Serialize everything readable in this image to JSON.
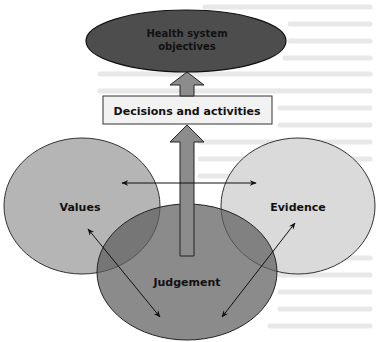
{
  "diagram": {
    "nodes": {
      "objectives": {
        "line1": "Health system",
        "line2": "objectives",
        "fill": "#4d4d4d"
      },
      "decisions": {
        "label": "Decisions and activities",
        "fill": "#f2f2f2"
      },
      "values": {
        "label": "Values",
        "fill": "#b3b3b3"
      },
      "evidence": {
        "label": "Evidence",
        "fill": "#d9d9d9"
      },
      "judgement": {
        "label": "Judgement",
        "fill": "#7a7a7a"
      }
    },
    "arrows": [
      {
        "from": "decisions",
        "to": "objectives",
        "type": "block-arrow"
      },
      {
        "from": "judgement",
        "to": "decisions",
        "type": "block-arrow"
      },
      {
        "from": "values",
        "to": "evidence",
        "type": "bidirectional"
      },
      {
        "from": "values",
        "to": "judgement",
        "type": "bidirectional"
      },
      {
        "from": "evidence",
        "to": "judgement",
        "type": "bidirectional"
      }
    ],
    "colors": {
      "outline": "#222222",
      "block_arrow": "#8c8c8c",
      "background_text": "#e6e6e6"
    }
  }
}
